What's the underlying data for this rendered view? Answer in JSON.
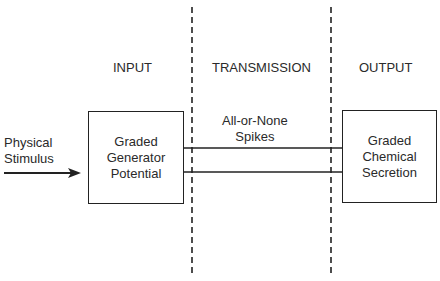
{
  "diagram": {
    "sections": [
      {
        "id": "input",
        "label": "INPUT"
      },
      {
        "id": "transmission",
        "label": "TRANSMISSION"
      },
      {
        "id": "output",
        "label": "OUTPUT"
      }
    ],
    "stimulus": {
      "label": "Physical\nStimulus"
    },
    "input_box": {
      "label": "Graded\nGenerator\nPotential"
    },
    "transmission_label": {
      "label": "All-or-None\nSpikes"
    },
    "output_box": {
      "label": "Graded\nChemical\nSecretion"
    },
    "colors": {
      "line": "#222222",
      "text": "#2a2a2a",
      "background": "#ffffff"
    }
  }
}
